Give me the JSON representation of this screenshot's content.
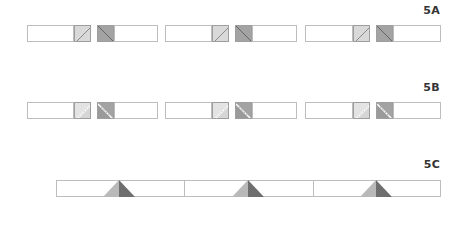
{
  "diagram": {
    "colors": {
      "outline": "#bdbdbd",
      "light_fabric": "#d9d9d9",
      "dark_fabric": "#a3a3a3",
      "tri_light": "#b9b9b9",
      "tri_dark": "#6e6e6e",
      "seam": "#ffffff"
    },
    "steps": [
      {
        "label": "5A",
        "description": "Three units: white strip + light half-square with diagonal + dark half-square with diagonal + white strip",
        "units": 3
      },
      {
        "label": "5B",
        "description": "Three units: squares stitched along diagonal, corners folded/trimmed",
        "units": 3
      },
      {
        "label": "5C",
        "description": "Joined long strip of three segments, each with a two-tone triangle (light left half, dark right half) pointing up",
        "segments": 3
      }
    ]
  }
}
